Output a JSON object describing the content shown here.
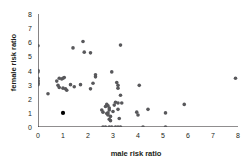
{
  "chart_data": {
    "type": "scatter",
    "title": "",
    "xlabel": "male risk ratio",
    "ylabel": "female risk ratio",
    "xlim": [
      0,
      8
    ],
    "ylim": [
      0,
      8
    ],
    "xticks": [
      0,
      1,
      2,
      3,
      4,
      5,
      6,
      7,
      8
    ],
    "yticks": [
      0,
      1,
      2,
      3,
      4,
      5,
      6,
      7,
      8
    ],
    "grid": false,
    "legend": null,
    "marker": {
      "shape": "circle",
      "color": "#58585b",
      "size": 3.6,
      "highlight_color": "#000000",
      "highlight_size": 4.2
    },
    "series": [
      {
        "name": "studies",
        "points": [
          [
            0.0,
            5.75
          ],
          [
            0.0,
            4.0
          ],
          [
            0.0,
            3.9
          ],
          [
            0.0,
            3.45
          ],
          [
            0.0,
            3.3
          ],
          [
            0.0,
            3.2
          ],
          [
            0.0,
            3.1
          ],
          [
            0.0,
            3.0
          ],
          [
            0.4,
            2.35
          ],
          [
            0.75,
            3.25
          ],
          [
            0.85,
            3.45
          ],
          [
            0.95,
            3.4
          ],
          [
            1.0,
            3.45
          ],
          [
            1.05,
            3.5
          ],
          [
            0.8,
            2.95
          ],
          [
            0.85,
            2.8
          ],
          [
            1.0,
            2.75
          ],
          [
            1.1,
            2.7
          ],
          [
            1.15,
            2.6
          ],
          [
            1.3,
            3.0
          ],
          [
            1.4,
            5.6
          ],
          [
            1.45,
            2.85
          ],
          [
            1.7,
            3.0
          ],
          [
            1.8,
            6.05
          ],
          [
            1.85,
            5.3
          ],
          [
            2.1,
            5.25
          ],
          [
            2.1,
            2.7
          ],
          [
            2.2,
            3.1
          ],
          [
            2.3,
            3.7
          ],
          [
            2.3,
            3.55
          ],
          [
            2.95,
            3.9
          ],
          [
            3.15,
            3.15
          ],
          [
            3.3,
            5.8
          ],
          [
            3.2,
            2.95
          ],
          [
            3.2,
            2.75
          ],
          [
            4.05,
            2.95
          ],
          [
            7.9,
            3.45
          ],
          [
            3.3,
            2.25
          ],
          [
            2.55,
            1.2
          ],
          [
            2.6,
            1.05
          ],
          [
            2.7,
            1.45
          ],
          [
            2.75,
            1.6
          ],
          [
            2.8,
            1.5
          ],
          [
            2.85,
            1.35
          ],
          [
            2.85,
            1.2
          ],
          [
            2.8,
            1.0
          ],
          [
            2.75,
            0.95
          ],
          [
            2.8,
            0.85
          ],
          [
            2.9,
            0.75
          ],
          [
            2.85,
            0.55
          ],
          [
            2.9,
            0.45
          ],
          [
            3.0,
            1.1
          ],
          [
            3.05,
            1.55
          ],
          [
            3.1,
            1.75
          ],
          [
            3.2,
            1.7
          ],
          [
            3.35,
            1.7
          ],
          [
            3.2,
            1.25
          ],
          [
            3.25,
            0.6
          ],
          [
            3.95,
            1.05
          ],
          [
            4.0,
            0.85
          ],
          [
            4.4,
            1.25
          ],
          [
            5.1,
            1.0
          ],
          [
            5.85,
            1.6
          ],
          [
            1.0,
            1.0
          ],
          [
            2.6,
            0.0
          ],
          [
            2.7,
            0.0
          ],
          [
            2.85,
            0.0
          ],
          [
            2.95,
            0.0
          ],
          [
            3.1,
            0.0
          ],
          [
            3.2,
            0.0
          ],
          [
            3.3,
            0.0
          ],
          [
            4.2,
            0.0
          ],
          [
            5.1,
            0.0
          ]
        ],
        "highlighted_points": [
          [
            1.0,
            1.0
          ]
        ]
      }
    ]
  }
}
